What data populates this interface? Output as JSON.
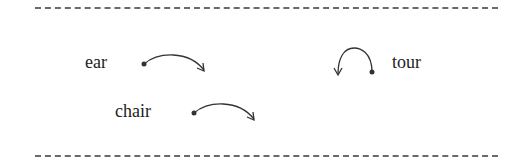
{
  "diagram": {
    "type": "sound-transition-arrows",
    "items": [
      {
        "word": "ear",
        "arrow": "forward-arc"
      },
      {
        "word": "chair",
        "arrow": "forward-arc"
      },
      {
        "word": "tour",
        "arrow": "backward-loop"
      }
    ],
    "colors": {
      "text": "#222222",
      "arrow": "#333333",
      "dash": "#6a6a6a"
    }
  }
}
